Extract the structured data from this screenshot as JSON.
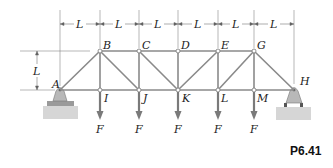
{
  "figure": {
    "id_label": "P6.41",
    "type": "Planar truss with pin support A and roller support H"
  },
  "dimensions": {
    "spacing_labels": [
      "L",
      "L",
      "L",
      "L",
      "L",
      "L"
    ],
    "height_label": "L"
  },
  "joints": {
    "top": [
      {
        "name": "B",
        "x": 100,
        "y": 51
      },
      {
        "name": "C",
        "x": 139,
        "y": 51
      },
      {
        "name": "D",
        "x": 178,
        "y": 51
      },
      {
        "name": "E",
        "x": 218,
        "y": 51
      },
      {
        "name": "G",
        "x": 254,
        "y": 51
      }
    ],
    "bottom": [
      {
        "name": "A",
        "x": 60,
        "y": 90
      },
      {
        "name": "I",
        "x": 100,
        "y": 90
      },
      {
        "name": "J",
        "x": 139,
        "y": 90
      },
      {
        "name": "K",
        "x": 178,
        "y": 90
      },
      {
        "name": "L",
        "x": 218,
        "y": 90
      },
      {
        "name": "M",
        "x": 254,
        "y": 90
      },
      {
        "name": "H",
        "x": 294,
        "y": 90
      }
    ]
  },
  "loads": [
    {
      "joint": "I",
      "label": "F"
    },
    {
      "joint": "J",
      "label": "F"
    },
    {
      "joint": "K",
      "label": "F"
    },
    {
      "joint": "L",
      "label": "F"
    },
    {
      "joint": "M",
      "label": "F"
    }
  ],
  "colors": {
    "member": "#8a8a8a",
    "arrow": "#7a7a7a",
    "support": "#b5b5b5",
    "ground": "#cfcfcf",
    "dim_line": "#777777"
  }
}
